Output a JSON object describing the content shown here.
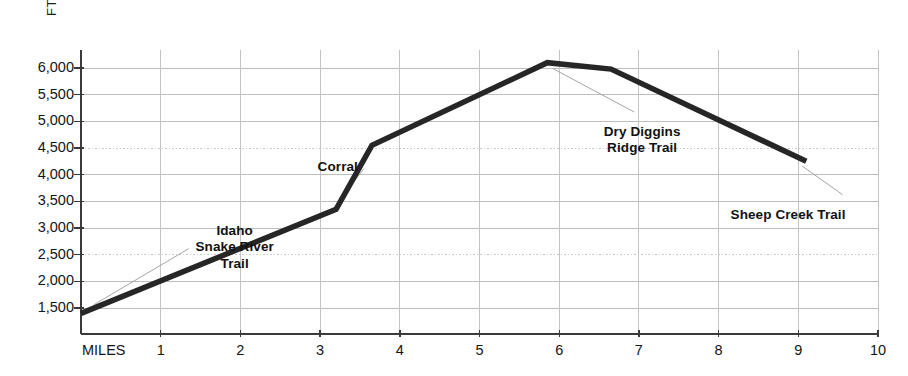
{
  "chart_data": {
    "type": "line",
    "title": "",
    "xlabel": "MILES",
    "ylabel": "FT",
    "xlim": [
      0,
      10
    ],
    "ylim": [
      1000,
      6250
    ],
    "grid": true,
    "legend": "none",
    "x_tick_labels": [
      "1",
      "2",
      "3",
      "4",
      "5",
      "6",
      "7",
      "8",
      "9",
      "10"
    ],
    "x_tick_values": [
      1,
      2,
      3,
      4,
      5,
      6,
      7,
      8,
      9,
      10
    ],
    "y_tick_labels": [
      "1,500",
      "2,000",
      "2,500",
      "3,000",
      "3,500",
      "4,000",
      "4,500",
      "5,000",
      "5,500",
      "6,000"
    ],
    "y_tick_values": [
      1500,
      2000,
      2500,
      3000,
      3500,
      4000,
      4500,
      5000,
      5500,
      6000
    ],
    "series": [
      {
        "name": "Trail elevation profile",
        "color": "#262626",
        "x": [
          0.0,
          3.2,
          3.65,
          5.85,
          6.65,
          9.1
        ],
        "y": [
          1400,
          3350,
          4550,
          6100,
          5980,
          4250
        ]
      }
    ],
    "annotations": [
      {
        "id": "idaho-snake-river-trail",
        "text": "Idaho\nSnake River\nTrail",
        "label_x": 1.05,
        "label_y": 3100,
        "point_x": 0.16,
        "point_y": 1560
      },
      {
        "id": "corral",
        "text": "Corral",
        "label_x": 2.72,
        "label_y": 4300,
        "point_x": 3.2,
        "point_y": 3430
      },
      {
        "id": "dry-diggins-ridge-trail",
        "text": "Dry Diggins\nRidge Trail",
        "label_x": 6.1,
        "label_y": 4950,
        "point_x": 5.92,
        "point_y": 5990
      },
      {
        "id": "sheep-creek-trail",
        "text": "Sheep Creek Trail",
        "label_x": 8.15,
        "label_y": 3400,
        "point_x": 9.05,
        "point_y": 4160
      }
    ]
  },
  "axes": {
    "y_unit": "FT",
    "x_unit": "MILES"
  }
}
